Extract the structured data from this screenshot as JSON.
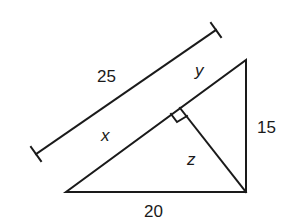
{
  "diagram": {
    "type": "right triangle with altitude to hypotenuse",
    "labels": {
      "hypotenuse_total": "25",
      "segment_y": "y",
      "segment_x": "x",
      "altitude_z": "z",
      "vertical_leg": "15",
      "base_leg": "20"
    },
    "stroke_color": "#1a1a1a",
    "background": "#ffffff"
  }
}
